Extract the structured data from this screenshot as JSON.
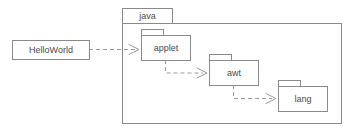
{
  "diagram": {
    "kind": "uml-package-dependency-diagram",
    "width": 349,
    "height": 132,
    "background_color": "#ffffff",
    "stroke_color": "#8a8a8a",
    "dependency_color": "#9a9a9a",
    "text_color": "#4a4a4a"
  },
  "frame": {
    "label": "java",
    "type": "package",
    "tab": {
      "x": 122,
      "y": 8,
      "width": 50,
      "height": 15
    },
    "body": {
      "x": 122,
      "y": 23,
      "width": 220,
      "height": 101
    }
  },
  "nodes": [
    {
      "id": "helloworld",
      "label": "HelloWorld",
      "type": "class",
      "box": {
        "x": 12,
        "y": 40,
        "width": 77,
        "height": 19
      }
    },
    {
      "id": "applet",
      "label": "applet",
      "type": "package",
      "tab": {
        "x": 141,
        "y": 29,
        "width": 22,
        "height": 6
      },
      "box": {
        "x": 141,
        "y": 35,
        "width": 49,
        "height": 25
      }
    },
    {
      "id": "awt",
      "label": "awt",
      "type": "package",
      "tab": {
        "x": 209,
        "y": 54,
        "width": 22,
        "height": 6
      },
      "box": {
        "x": 209,
        "y": 60,
        "width": 49,
        "height": 25
      }
    },
    {
      "id": "lang",
      "label": "lang",
      "type": "package",
      "tab": {
        "x": 278,
        "y": 80,
        "width": 22,
        "height": 6
      },
      "box": {
        "x": 278,
        "y": 86,
        "width": 49,
        "height": 25
      }
    }
  ],
  "dependencies": [
    {
      "id": "dep-helloworld-applet",
      "from": "helloworld",
      "to": "applet",
      "style": "dashed",
      "arrowhead": "open",
      "path": "M 89 49.5 L 135 49.5",
      "head": "M 129 44.5 L 139 49.5 L 129 54.5"
    },
    {
      "id": "dep-applet-awt",
      "from": "applet",
      "to": "awt",
      "style": "dashed",
      "arrowhead": "open",
      "path": "M 165.5 60 L 165.5 73 L 203 73",
      "head": "M 197 68 L 207 73 L 197 78"
    },
    {
      "id": "dep-awt-lang",
      "from": "awt",
      "to": "lang",
      "style": "dashed",
      "arrowhead": "open",
      "path": "M 233.5 85 L 233.5 98.5 L 272 98.5",
      "head": "M 266 93.5 L 276 98.5 L 266 103.5"
    }
  ]
}
